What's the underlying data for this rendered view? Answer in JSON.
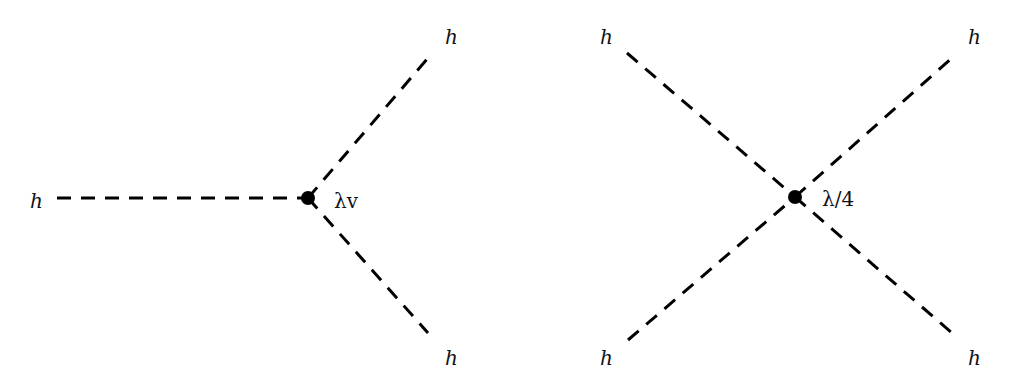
{
  "diagrams": [
    {
      "name": "trilinear-higgs-vertex",
      "vertex": {
        "x": 308,
        "y": 198
      },
      "coupling_label": "λv",
      "legs": [
        {
          "label": "h",
          "end": {
            "x": 57,
            "y": 198
          },
          "label_pos": {
            "x": 30,
            "y": 208
          }
        },
        {
          "label": "h",
          "end": {
            "x": 428,
            "y": 58
          },
          "label_pos": {
            "x": 445,
            "y": 44
          }
        },
        {
          "label": "h",
          "end": {
            "x": 428,
            "y": 333
          },
          "label_pos": {
            "x": 445,
            "y": 363
          }
        }
      ]
    },
    {
      "name": "quartic-higgs-vertex",
      "vertex": {
        "x": 795,
        "y": 197
      },
      "coupling_label": "λ/4",
      "legs": [
        {
          "label": "h",
          "end": {
            "x": 627,
            "y": 53
          },
          "label_pos": {
            "x": 600,
            "y": 44
          }
        },
        {
          "label": "h",
          "end": {
            "x": 952,
            "y": 58
          },
          "label_pos": {
            "x": 968,
            "y": 44
          }
        },
        {
          "label": "h",
          "end": {
            "x": 628,
            "y": 340
          },
          "label_pos": {
            "x": 600,
            "y": 363
          }
        },
        {
          "label": "h",
          "end": {
            "x": 952,
            "y": 333
          },
          "label_pos": {
            "x": 968,
            "y": 363
          }
        }
      ]
    }
  ],
  "labels": {
    "left_in": "h",
    "left_out_top": "h",
    "left_out_bottom": "h",
    "left_coupling": "λv",
    "right_top_left": "h",
    "right_top_right": "h",
    "right_bottom_left": "h",
    "right_bottom_right": "h",
    "right_coupling": "λ/4"
  }
}
